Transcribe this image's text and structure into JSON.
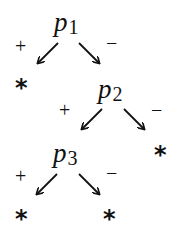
{
  "diagram": {
    "type": "decision-tree",
    "nodes": [
      {
        "id": "p1",
        "label": "p",
        "subscript": "1"
      },
      {
        "id": "p2",
        "label": "p",
        "subscript": "2"
      },
      {
        "id": "p3",
        "label": "p",
        "subscript": "3"
      }
    ],
    "edges": [
      {
        "from": "p1",
        "to": "leaf1",
        "sign": "+"
      },
      {
        "from": "p1",
        "to": "p2",
        "sign": "−"
      },
      {
        "from": "p2",
        "to": "p3",
        "sign": "+"
      },
      {
        "from": "p2",
        "to": "leaf2",
        "sign": "−"
      },
      {
        "from": "p3",
        "to": "leaf3",
        "sign": "+"
      },
      {
        "from": "p3",
        "to": "leaf4",
        "sign": "−"
      }
    ],
    "leaf_symbol": "*",
    "plus": "+",
    "minus": "−"
  }
}
